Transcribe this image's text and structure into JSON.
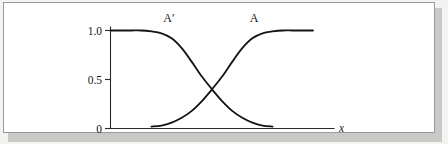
{
  "figure": {
    "caption_visible": false,
    "background_color": "#f3f3f1",
    "plate_color": "#ffffff",
    "plate_border_color": "#9a9a98",
    "ink_color": "#141418"
  },
  "chart_data": {
    "type": "line",
    "title": "",
    "subtitle": "",
    "xlabel": "x",
    "ylabel": "",
    "xlim": [
      0,
      1
    ],
    "ylim": [
      0,
      1.08
    ],
    "grid": false,
    "legend": "inline-curve-labels",
    "y_ticks": [
      {
        "value": 1.0,
        "label": "1.0"
      },
      {
        "value": 0.5,
        "label": "0.5"
      },
      {
        "value": 0.0,
        "label": "0"
      }
    ],
    "x_ticks": [],
    "annotations": [
      {
        "text": "A′",
        "x": 0.33,
        "y": 1.06,
        "target_series": "A'"
      },
      {
        "text": "A",
        "x": 0.63,
        "y": 1.06,
        "target_series": "A"
      }
    ],
    "crossing_point": {
      "x": 0.5,
      "y": 0.4
    },
    "series": [
      {
        "name": "A'",
        "description": "complement membership function, decreasing sigmoid from 1.0 to 0",
        "x": [
          0.0,
          0.05,
          0.1,
          0.15,
          0.2,
          0.25,
          0.3,
          0.35,
          0.4,
          0.45,
          0.5,
          0.55,
          0.6,
          0.65,
          0.7,
          0.75,
          0.8
        ],
        "values": [
          1.0,
          1.0,
          1.0,
          1.0,
          0.99,
          0.97,
          0.92,
          0.82,
          0.68,
          0.53,
          0.4,
          0.28,
          0.18,
          0.11,
          0.06,
          0.03,
          0.02
        ]
      },
      {
        "name": "A",
        "description": "membership function, increasing sigmoid from 0 to 1.0",
        "x": [
          0.2,
          0.25,
          0.3,
          0.35,
          0.4,
          0.45,
          0.5,
          0.55,
          0.6,
          0.65,
          0.7,
          0.75,
          0.8,
          0.85,
          0.9,
          0.95,
          1.0
        ],
        "values": [
          0.02,
          0.03,
          0.06,
          0.11,
          0.18,
          0.28,
          0.4,
          0.53,
          0.68,
          0.82,
          0.92,
          0.97,
          0.99,
          1.0,
          1.0,
          1.0,
          1.0
        ]
      }
    ]
  }
}
